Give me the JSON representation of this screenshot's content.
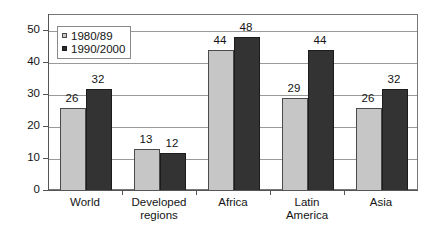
{
  "chart_data": {
    "type": "bar",
    "title": "",
    "subtitle": "",
    "xlabel": "",
    "ylabel": "",
    "categories": [
      "World",
      "Developed regions",
      "Africa",
      "Latin America",
      "Asia"
    ],
    "category_lines": [
      [
        "World"
      ],
      [
        "Developed",
        "regions"
      ],
      [
        "Africa"
      ],
      [
        "Latin",
        "America"
      ],
      [
        "Asia"
      ]
    ],
    "series": [
      {
        "name": "1980/89",
        "values": [
          26,
          13,
          44,
          29,
          26
        ],
        "color": "#c6c6c6"
      },
      {
        "name": "1990/2000",
        "values": [
          32,
          12,
          48,
          44,
          32
        ],
        "color": "#333333"
      }
    ],
    "ylim": [
      0,
      55
    ],
    "yticks": [
      0,
      10,
      20,
      30,
      40,
      50
    ],
    "ytick_labels": [
      "0",
      "10",
      "20",
      "30",
      "40",
      "50"
    ],
    "grid": "horizontal",
    "legend_position": "top-left-inside",
    "data_labels": true
  }
}
